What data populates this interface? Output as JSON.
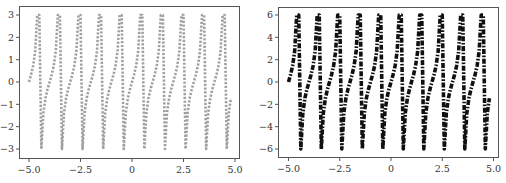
{
  "chart_data": [
    {
      "type": "line",
      "title": "",
      "xlabel": "",
      "ylabel": "",
      "function": "clip(tan(pi*x), -3, 3)",
      "xlim": [
        -5.3,
        5.2
      ],
      "ylim": [
        -3.35,
        3.4
      ],
      "grid": false,
      "legend": null,
      "xticks": [
        -5.0,
        -2.5,
        0,
        2.5,
        5.0
      ],
      "xtick_labels": [
        "−5.0",
        "−2.5",
        "0",
        "2.5",
        "5.0"
      ],
      "yticks": [
        3,
        2,
        1,
        0,
        -1,
        -2,
        -3
      ],
      "ytick_labels": [
        "3",
        "2",
        "1",
        "0",
        "−1",
        "−2",
        "−3"
      ],
      "series": [
        {
          "name": "tan clipped ±3",
          "color": "#a0a0a0",
          "linestyle": "dotted",
          "x_start": -5.0,
          "x_step": 0.1,
          "values": [
            0,
            0.325,
            0.727,
            1.376,
            3,
            3,
            -3,
            -1.376,
            -0.727,
            -0.325,
            0,
            0.325,
            0.727,
            1.376,
            3,
            3,
            -3,
            -1.376,
            -0.727,
            -0.325,
            0,
            0.325,
            0.727,
            1.376,
            3,
            3,
            -3,
            -1.376,
            -0.727,
            -0.325,
            0,
            0.325,
            0.727,
            1.376,
            3,
            3,
            -3,
            -1.376,
            -0.727,
            -0.325,
            0,
            0.325,
            0.727,
            1.376,
            3,
            3,
            -3,
            -1.376,
            -0.727,
            -0.325,
            0,
            0.325,
            0.727,
            1.376,
            3,
            3,
            -3,
            -1.376,
            -0.727,
            -0.325,
            0,
            0.325,
            0.727,
            1.376,
            3,
            3,
            -3,
            -1.376,
            -0.727,
            -0.325,
            0,
            0.325,
            0.727,
            1.376,
            3,
            3,
            -3,
            -1.376,
            -0.727,
            -0.325,
            0,
            0.325,
            0.727,
            1.376,
            3,
            3,
            -3,
            -1.376,
            -0.727,
            -0.325,
            0,
            0.325,
            0.727,
            1.376,
            3,
            3,
            -3,
            -1.376,
            -0.727
          ]
        }
      ]
    },
    {
      "type": "line",
      "title": "",
      "xlabel": "",
      "ylabel": "",
      "function": "clip(2*tan(pi*x), -6, 6)",
      "xlim": [
        -5.3,
        5.2
      ],
      "ylim": [
        -6.7,
        6.8
      ],
      "grid": false,
      "legend": null,
      "xticks": [
        -5.0,
        -2.5,
        0,
        2.5,
        5.0
      ],
      "xtick_labels": [
        "−5.0",
        "−2.5",
        "0",
        "2.5",
        "5.0"
      ],
      "yticks": [
        6,
        4,
        2,
        0,
        -2,
        -4,
        -6
      ],
      "ytick_labels": [
        "6",
        "4",
        "2",
        "0",
        "−2",
        "−4",
        "−6"
      ],
      "series": [
        {
          "name": "2·tan clipped ±6",
          "color": "#111111",
          "linestyle": "dashdot",
          "x_start": -5.0,
          "x_step": 0.1,
          "values": [
            0,
            0.65,
            1.45,
            2.75,
            6,
            6,
            -6,
            -2.75,
            -1.45,
            -0.65,
            0,
            0.65,
            1.45,
            2.75,
            6,
            6,
            -6,
            -2.75,
            -1.45,
            -0.65,
            0,
            0.65,
            1.45,
            2.75,
            6,
            6,
            -6,
            -2.75,
            -1.45,
            -0.65,
            0,
            0.65,
            1.45,
            2.75,
            6,
            6,
            -6,
            -2.75,
            -1.45,
            -0.65,
            0,
            0.65,
            1.45,
            2.75,
            6,
            6,
            -6,
            -2.75,
            -1.45,
            -0.65,
            0,
            0.65,
            1.45,
            2.75,
            6,
            6,
            -6,
            -2.75,
            -1.45,
            -0.65,
            0,
            0.65,
            1.45,
            2.75,
            6,
            6,
            -6,
            -2.75,
            -1.45,
            -0.65,
            0,
            0.65,
            1.45,
            2.75,
            6,
            6,
            -6,
            -2.75,
            -1.45,
            -0.65,
            0,
            0.65,
            1.45,
            2.75,
            6,
            6,
            -6,
            -2.75,
            -1.45,
            -0.65,
            0,
            0.65,
            1.45,
            2.75,
            6,
            6,
            -6,
            -2.75,
            -1.45
          ]
        }
      ]
    }
  ]
}
